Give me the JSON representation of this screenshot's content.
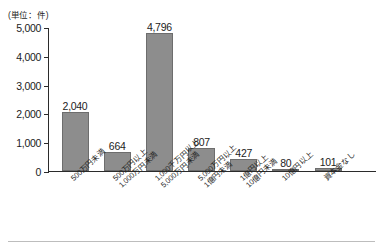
{
  "unit_caption": "(単位：件)",
  "chart_data": {
    "type": "bar",
    "title": "",
    "xlabel": "",
    "ylabel": "",
    "unit": "件",
    "unit_note": "(単位：件)",
    "ylim": [
      0,
      5000
    ],
    "yticks": [
      0,
      1000,
      2000,
      3000,
      4000,
      5000
    ],
    "ytick_labels": [
      "0",
      "1,000",
      "2,000",
      "3,000",
      "4,000",
      "5,000"
    ],
    "grid": false,
    "legend": null,
    "bar_color": "#8d8d8d",
    "bar_edge_color": "#6d6d6d",
    "axis_color": "#2b2b2b",
    "categories": [
      "500万円未満",
      "500万円以上 1,000万円未満",
      "1,000千万円以上 5,000万円未満",
      "5,000万円以上 1億円未満",
      "1億円以上 10億円未満",
      "10億円以上",
      "資本金なし"
    ],
    "category_lines": [
      [
        "500万円未満",
        ""
      ],
      [
        "500万円以上",
        "1,000万円未満"
      ],
      [
        "1,000千万円以上",
        "5,000万円未満"
      ],
      [
        "5,000万円以上",
        "1億円未満"
      ],
      [
        "1億円以上",
        "10億円未満"
      ],
      [
        "10億円以上",
        ""
      ],
      [
        "資本金なし",
        ""
      ]
    ],
    "values": [
      2040,
      664,
      4796,
      807,
      427,
      80,
      101
    ],
    "value_labels": [
      "2,040",
      "664",
      "4,796",
      "807",
      "427",
      "80",
      "101"
    ]
  }
}
